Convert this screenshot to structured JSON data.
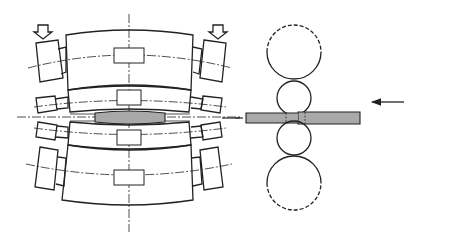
{
  "front_view": {
    "rolling_load_label": "rolling load",
    "upper_backup_label": "BUR",
    "upper_work_label": "WR",
    "strip_label": "Strip",
    "lower_work_label": "WR",
    "lower_backup_label": "BUR"
  },
  "side_view": {
    "upper_work_label": "WR",
    "lower_work_label": "WR",
    "strip_label": "strip",
    "direction_label_line1": "direction",
    "direction_label_line2": "of rolling",
    "forward_symbol": "σf",
    "forward_label_line1": "forward",
    "forward_label_line2": "tension",
    "backward_symbol": "σb",
    "backward_label_line1": "backward",
    "backward_label_line2": "tension",
    "caption": "side view"
  },
  "colors": {
    "line": "#222222",
    "strip_fill": "#a9a9a9",
    "background": "#ffffff"
  }
}
